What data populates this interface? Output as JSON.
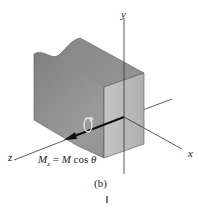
{
  "figure": {
    "caption": "(b)",
    "axes": {
      "x_label": "x",
      "y_label": "y",
      "z_label": "z"
    },
    "equation": {
      "lhs_symbol": "M",
      "lhs_subscript": "z",
      "equals": "=",
      "rhs": "M cos θ",
      "rhs_m": "M",
      "rhs_cos": "cos",
      "rhs_theta": "θ"
    },
    "colors": {
      "front_face": "#b8b8b8",
      "side_face": "#8f8f8f",
      "top_face": "#a6a6a6",
      "axis": "#333333",
      "arrow": "#111111"
    }
  }
}
